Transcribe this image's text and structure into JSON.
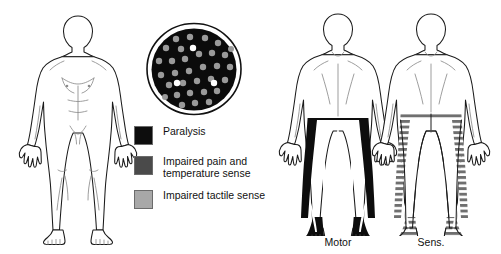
{
  "figure": {
    "background": "#ffffff",
    "line_color": "#1a1a1a"
  },
  "legend": {
    "items": [
      {
        "id": "paralysis",
        "label": "Paralysis",
        "color": "#0d0d0d",
        "icon": "black-square-swatch"
      },
      {
        "id": "pain-temperature",
        "label": "Impaired pain and\ntemperature sense",
        "color": "#4a4a4a",
        "icon": "dark-gray-square-swatch"
      },
      {
        "id": "tactile",
        "label": "Impaired tactile sense",
        "color": "#a8a8a8",
        "icon": "light-gray-square-swatch"
      }
    ]
  },
  "cord_cross_section": {
    "name": "spinal-cord-cross-section",
    "outline_color": "#111111",
    "fill_color": "#0b0b0b",
    "dot_color": "#9a9a9a",
    "highlight_dot_color": "#ffffff",
    "dot_count": 35,
    "highlight_dot_count": 3
  },
  "bodies": [
    {
      "id": "anterior-unshaded",
      "view": "anterior",
      "caption": "",
      "shading": "none"
    },
    {
      "id": "motor",
      "view": "posterior",
      "caption": "Motor",
      "shading": "solid-black",
      "shading_color": "#0d0d0d",
      "shaded_region": "legs-and-pelvis"
    },
    {
      "id": "sensory",
      "view": "posterior",
      "caption": "Sens.",
      "shading": "horizontal-stripes",
      "shading_color": "#6f6f6f",
      "shaded_region": "legs-and-pelvis"
    }
  ]
}
